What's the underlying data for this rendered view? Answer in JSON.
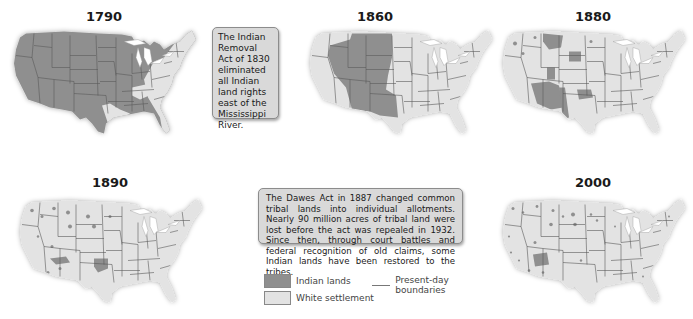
{
  "maps": [
    {
      "year": "1790",
      "id": "map-1790",
      "description": "Indian lands cover nearly all land west of the Appalachians; white settlement along East Coast, east Texas/Louisiana strip"
    },
    {
      "year": "1860",
      "id": "map-1860",
      "description": "Indian lands cover the Great Plains, Great Basin, Southwest and Texas interior; white settlement in the East, Pacific coast, Oregon"
    },
    {
      "year": "1880",
      "id": "map-1880",
      "description": "Indian lands reduced to scattered areas: Montana, Dakota, Indian Territory, Arizona/New Mexico, west Texas, Utah/Colorado"
    },
    {
      "year": "1890",
      "id": "map-1890",
      "description": "Small scattered reservations; larger areas in Indian Territory (Oklahoma) and Arizona"
    },
    {
      "year": "2000",
      "id": "map-2000",
      "description": "Many small scattered reservations; largest in Arizona (Navajo)"
    }
  ],
  "callouts": {
    "removal_act": "The Indian Removal Act of 1830 eliminated all Indian land rights east of the Mississippi River.",
    "dawes_act": "The Dawes Act in 1887 changed common tribal lands into individual allotments. Nearly 90 million acres of tribal land were lost before the act was repealed in 1932. Since then, through court battles and federal recognition of old claims, some Indian lands have been restored to the tribes."
  },
  "legend": {
    "items": [
      {
        "label": "Indian lands",
        "color": "#8f8f8f"
      },
      {
        "label": "White settlement",
        "color": "#e3e3e3"
      },
      {
        "label": "Present-day boundaries",
        "color": "#6e6e6e"
      }
    ]
  },
  "colors": {
    "indian_lands": "#8f8f8f",
    "white_settlement": "#e3e3e3",
    "boundaries": "#5a5a5a",
    "lakes": "#ffffff",
    "callout_bg": "#d9d9d9"
  }
}
